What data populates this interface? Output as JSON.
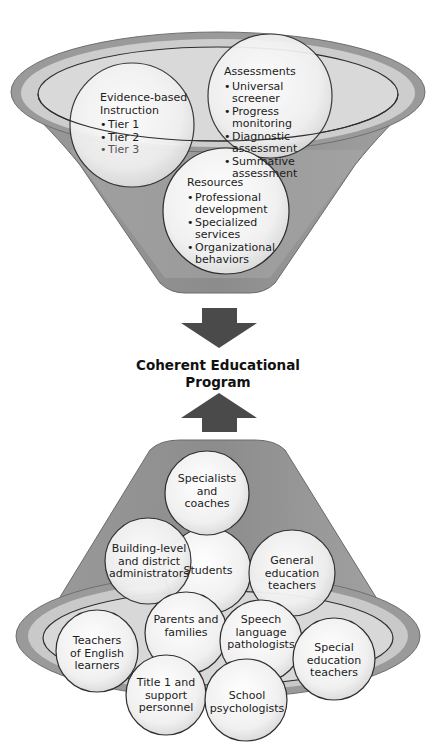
{
  "diagram": {
    "center_label": {
      "line1": "Coherent Educational",
      "line2": "Program"
    },
    "top_funnel": {
      "circles": [
        {
          "title_line1": "Evidence-based",
          "title_line2": "Instruction",
          "items": [
            "Tier 1",
            "Tier 2",
            "Tier 3"
          ]
        },
        {
          "title": "Assessments",
          "items": [
            "Universal screener",
            "Progress monitoring",
            "Diagnostic assessment",
            "Summative assessment"
          ]
        },
        {
          "title": "Resources",
          "items": [
            "Professional development",
            "Specialized services",
            "Organizational behaviors"
          ]
        }
      ]
    },
    "bottom_funnel": {
      "circles": [
        {
          "id": "specialists",
          "label": "Specialists and coaches"
        },
        {
          "id": "students",
          "label": "Students"
        },
        {
          "id": "administrators",
          "label": "Building-level and district administrators"
        },
        {
          "id": "general-ed",
          "label": "General education teachers"
        },
        {
          "id": "parents",
          "label": "Parents and families"
        },
        {
          "id": "slp",
          "label": "Speech language pathologists"
        },
        {
          "id": "ell-teachers",
          "label": "Teachers of English learners"
        },
        {
          "id": "special-ed",
          "label": "Special education teachers"
        },
        {
          "id": "title1",
          "label": "Title 1 and support personnel"
        },
        {
          "id": "psychologists",
          "label": "School psychologists"
        }
      ]
    },
    "arrows": {
      "top": "arrow-down",
      "bottom": "arrow-up"
    },
    "colors": {
      "funnel_dark": "#8a8a8a",
      "funnel_mid": "#a9a9a9",
      "rim_light": "#cfcfcf",
      "circle_fill": "#f1f1f1",
      "outline": "#2e2e2e",
      "arrow": "#4a4a4a"
    }
  }
}
